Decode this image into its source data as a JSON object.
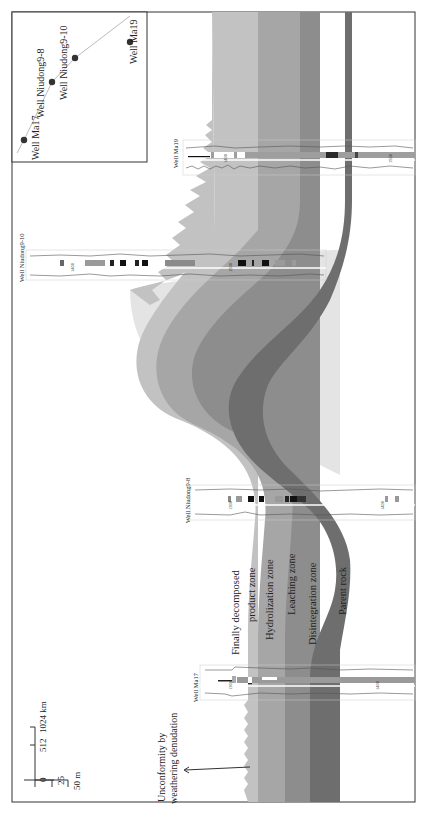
{
  "figure": {
    "type": "geological cross-section",
    "orientation": "rotated 90 degrees counter-clockwise"
  },
  "zones": [
    {
      "label": "Finally decomposed",
      "label2": "product zone",
      "color": "#c9c9c9"
    },
    {
      "label": "Hydrolization zone",
      "color": "#a3a3a3"
    },
    {
      "label": "Leaching zone",
      "color": "#8e8e8e"
    },
    {
      "label": "Disintegration zone",
      "color": "#6f6f6f"
    },
    {
      "label": "Parent rock",
      "color": "#ffffff"
    }
  ],
  "annotation": {
    "line1": "Unconformity by",
    "line2": "weathering denudation"
  },
  "scale": {
    "horizontal": {
      "ticks": [
        "0",
        "512",
        "1024 km"
      ]
    },
    "vertical": {
      "ticks": [
        "25",
        "50 m"
      ]
    }
  },
  "wells": [
    {
      "name": "Well Ma17",
      "depth_labels": [
        "1300",
        "1400"
      ]
    },
    {
      "name": "Well Niudong9-8",
      "depth_labels": [
        "1300",
        "1400"
      ]
    },
    {
      "name": "Well Niudong9-10",
      "depth_labels": [
        "1400",
        "1500"
      ]
    },
    {
      "name": "Well Ma19",
      "depth_labels": [
        "1400",
        "1500"
      ]
    }
  ],
  "log_headers": {
    "track1": [
      "GR",
      "0 150"
    ],
    "track2": [
      "SP",
      "RT"
    ],
    "track3": [
      "RLLD",
      "1.000"
    ]
  },
  "inset_map": {
    "wells": [
      "Well Ma17",
      "Well Niudong9-8",
      "Well Niudong9-10",
      "Well Ma19"
    ],
    "line_color": "#bbbbbb",
    "dot_color": "#333333"
  }
}
